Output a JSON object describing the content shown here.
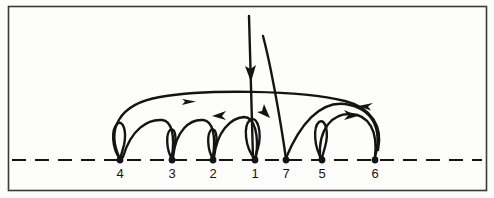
{
  "figure": {
    "border_color": "#3a3a3a",
    "background_color": "#fdfdfc",
    "ink_color": "#141414",
    "baseline": {
      "style": "dashed",
      "y": 160,
      "x_start": 12,
      "x_end": 482,
      "dash_pattern": "14 9"
    },
    "nodes": [
      {
        "id": "n4",
        "label": "4",
        "x": 120,
        "y": 160,
        "label_x": 120,
        "label_y": 166
      },
      {
        "id": "n3",
        "label": "3",
        "x": 172,
        "y": 160,
        "label_x": 172,
        "label_y": 166
      },
      {
        "id": "n2",
        "label": "2",
        "x": 213,
        "y": 160,
        "label_x": 213,
        "label_y": 166
      },
      {
        "id": "n1",
        "label": "1",
        "x": 255,
        "y": 160,
        "label_x": 255,
        "label_y": 166
      },
      {
        "id": "n7",
        "label": "7",
        "x": 286,
        "y": 160,
        "label_x": 286,
        "label_y": 166
      },
      {
        "id": "n5",
        "label": "5",
        "x": 322,
        "y": 160,
        "label_x": 322,
        "label_y": 166
      },
      {
        "id": "n6",
        "label": "6",
        "x": 375,
        "y": 160,
        "label_x": 375,
        "label_y": 166
      }
    ],
    "node_sequence": [
      "4",
      "3",
      "2",
      "1",
      "7",
      "5",
      "6"
    ],
    "node_dot_radius": 3.2,
    "arcs": [
      {
        "id": "arc-4-loop",
        "name": "loop-at-4",
        "from": "4",
        "to": "4",
        "direction": "none",
        "shape": "small-loop"
      },
      {
        "id": "arc-3-loop",
        "name": "loop-at-3",
        "from": "3",
        "to": "3",
        "direction": "none",
        "shape": "small-loop"
      },
      {
        "id": "arc-2-loop",
        "name": "loop-at-2",
        "from": "2",
        "to": "2",
        "direction": "none",
        "shape": "small-loop"
      },
      {
        "id": "arc-1-loop",
        "name": "loop-at-1",
        "from": "1",
        "to": "1",
        "direction": "none",
        "shape": "small-loop"
      },
      {
        "id": "arc-5-loop",
        "name": "loop-at-5",
        "from": "5",
        "to": "5",
        "direction": "none",
        "shape": "small-loop"
      },
      {
        "id": "arc-4-3",
        "name": "arc-4-to-3",
        "from": "4",
        "to": "3",
        "direction": "none",
        "shape": "hump"
      },
      {
        "id": "arc-3-2",
        "name": "arc-3-to-2",
        "from": "3",
        "to": "2",
        "direction": "none",
        "shape": "hump"
      },
      {
        "id": "arc-2-1",
        "name": "arc-2-to-1",
        "from": "2",
        "to": "1",
        "direction": "left",
        "shape": "hump"
      },
      {
        "id": "arc-4-6-long",
        "name": "long-arc-4-to-6",
        "from": "4",
        "to": "6",
        "direction": "right",
        "shape": "wide-arc"
      },
      {
        "id": "arc-5-6",
        "name": "arc-5-to-6",
        "from": "5",
        "to": "6",
        "direction": "right",
        "shape": "hump"
      },
      {
        "id": "arc-6-7",
        "name": "arc-6-back-to-7",
        "from": "6",
        "to": "7",
        "direction": "left",
        "shape": "wide-arc"
      },
      {
        "id": "arc-7-up",
        "name": "tall-riser-from-7",
        "from": "7",
        "to": "top",
        "direction": "up",
        "shape": "tall-curve"
      },
      {
        "id": "arc-in-1",
        "name": "tall-incoming-to-1",
        "from": "top",
        "to": "1",
        "direction": "down",
        "shape": "vertical-line"
      }
    ],
    "arrowheads": [
      {
        "name": "arrow-down-into-1",
        "x": 249,
        "y": 80,
        "angle": 90
      },
      {
        "name": "arrow-right-on-long-arc",
        "x": 192,
        "y": 101,
        "angle": 0
      },
      {
        "name": "arrow-left-into-1",
        "x": 228,
        "y": 115,
        "angle": 180
      },
      {
        "name": "arrow-up-from-7",
        "x": 267,
        "y": 112,
        "angle": -70
      },
      {
        "name": "arrow-right-on-5-6",
        "x": 356,
        "y": 116,
        "angle": -20
      },
      {
        "name": "arrow-left-on-6-7",
        "x": 367,
        "y": 107,
        "angle": 200
      }
    ]
  }
}
